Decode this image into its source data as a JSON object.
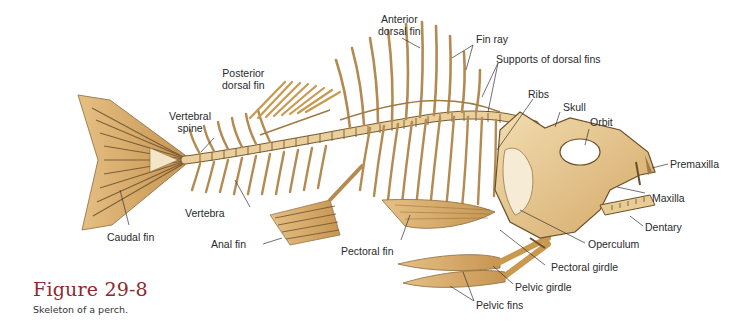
{
  "figure": {
    "title": "Figure 29-8",
    "caption": "Skeleton of a perch.",
    "title_color": "#8c2a2e"
  },
  "colors": {
    "bone": "#e2c48e",
    "bone_light": "#f0dcb2",
    "bone_dark": "#b58a4e",
    "outline": "#5a4326",
    "fin": "#d9ae6c",
    "leader": "#333333"
  },
  "labels": {
    "anterior_dorsal_fin": [
      "Anterior",
      "dorsal fin"
    ],
    "fin_ray": "Fin ray",
    "supports_of_dorsal_fins": "Supports of dorsal fins",
    "posterior_dorsal_fin": [
      "Posterior",
      "dorsal fin"
    ],
    "ribs": "Ribs",
    "skull": "Skull",
    "orbit": "Orbit",
    "premaxilla": "Premaxilla",
    "maxilla": "Maxilla",
    "dentary": "Dentary",
    "operculum": "Operculum",
    "pectoral_girdle": "Pectoral girdle",
    "pelvic_girdle": "Pelvic girdle",
    "pelvic_fins": "Pelvic fins",
    "pectoral_fin": "Pectoral fin",
    "anal_fin": "Anal fin",
    "vertebra": "Vertebra",
    "vertebral_spine": [
      "Vertebral",
      "spine"
    ],
    "caudal_fin": "Caudal fin"
  }
}
